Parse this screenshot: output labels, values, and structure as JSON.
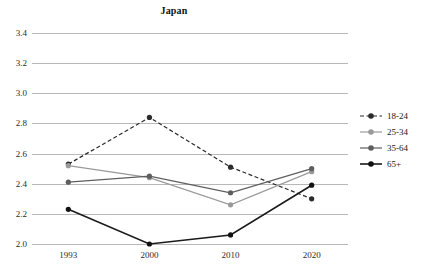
{
  "chart_data": {
    "type": "line",
    "title": "Japan",
    "xlabel": "",
    "ylabel": "",
    "categories": [
      "1993",
      "2000",
      "2010",
      "2020"
    ],
    "x": [
      1993,
      2000,
      2010,
      2020
    ],
    "ylim": [
      2.0,
      3.4
    ],
    "yticks": [
      "2.0",
      "2.2",
      "2.4",
      "2.6",
      "2.8",
      "3.0",
      "3.2",
      "3.4"
    ],
    "ytick_values": [
      2.0,
      2.2,
      2.4,
      2.6,
      2.8,
      3.0,
      3.2,
      3.4
    ],
    "grid": "horizontal",
    "legend_position": "right",
    "series": [
      {
        "name": "18-24",
        "values": [
          2.53,
          2.84,
          2.51,
          2.3
        ],
        "color": "#2b2b2b",
        "line_style": "dashed",
        "line_width": 1.2,
        "marker": "circle",
        "marker_color": "#2b2b2b"
      },
      {
        "name": "25-34",
        "values": [
          2.52,
          2.44,
          2.26,
          2.48
        ],
        "color": "#9a9a9a",
        "line_style": "solid",
        "line_width": 1.2,
        "marker": "circle",
        "marker_color": "#9a9a9a"
      },
      {
        "name": "35-64",
        "values": [
          2.41,
          2.45,
          2.34,
          2.5
        ],
        "color": "#5e5e5e",
        "line_style": "solid",
        "line_width": 1.2,
        "marker": "circle",
        "marker_color": "#5e5e5e"
      },
      {
        "name": "65+",
        "values": [
          2.23,
          2.0,
          2.06,
          2.39
        ],
        "color": "#1a1a1a",
        "line_style": "solid",
        "line_width": 1.6,
        "marker": "circle",
        "marker_color": "#111111"
      }
    ]
  },
  "colors": {
    "background": "#ffffff",
    "gridline": "#b8b8b8",
    "text": "#1a1a1a",
    "series_18_24": "#2b2b2b",
    "series_25_34": "#9a9a9a",
    "series_35_64": "#5e5e5e",
    "series_65_plus": "#111111"
  }
}
